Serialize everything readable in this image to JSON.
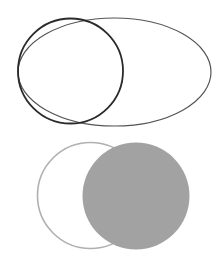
{
  "diagram": {
    "top_group": {
      "ellipse": {
        "cx": 114.5,
        "cy": 72,
        "rx": 96.5,
        "ry": 54,
        "stroke": "#555555",
        "stroke_width": 1.2,
        "fill": "none"
      },
      "circle": {
        "cx": 70.5,
        "cy": 71,
        "r": 52.5,
        "stroke": "#2a2a2a",
        "stroke_width": 1.8,
        "fill": "none"
      }
    },
    "bottom_group": {
      "outline_circle": {
        "cx": 90.5,
        "cy": 195.5,
        "r": 53,
        "stroke": "#b0b0b0",
        "stroke_width": 1.6,
        "fill": "#ffffff"
      },
      "filled_circle": {
        "cx": 136,
        "cy": 196,
        "r": 53.5,
        "stroke": "none",
        "fill": "#a2a2a2"
      }
    }
  }
}
